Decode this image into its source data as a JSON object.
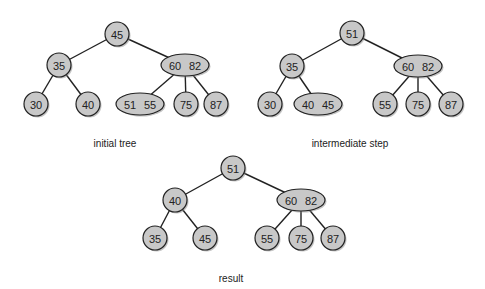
{
  "diagram": {
    "type": "2-3 tree deletion",
    "trees": [
      {
        "id": "initial",
        "caption": "initial tree",
        "nodes": [
          {
            "id": "n45",
            "keys": [
              "45"
            ],
            "cx": 117,
            "cy": 34
          },
          {
            "id": "n35",
            "keys": [
              "35"
            ],
            "cx": 59,
            "cy": 65
          },
          {
            "id": "n6082",
            "keys": [
              "60",
              "82"
            ],
            "cx": 185,
            "cy": 65
          },
          {
            "id": "n30",
            "keys": [
              "30"
            ],
            "cx": 36,
            "cy": 104
          },
          {
            "id": "n40",
            "keys": [
              "40"
            ],
            "cx": 88,
            "cy": 104
          },
          {
            "id": "n5155",
            "keys": [
              "51",
              "55"
            ],
            "cx": 140,
            "cy": 104
          },
          {
            "id": "n75",
            "keys": [
              "75"
            ],
            "cx": 186,
            "cy": 104
          },
          {
            "id": "n87",
            "keys": [
              "87"
            ],
            "cx": 216,
            "cy": 104
          }
        ],
        "edges": [
          [
            "n45",
            "n35"
          ],
          [
            "n45",
            "n6082"
          ],
          [
            "n35",
            "n30"
          ],
          [
            "n35",
            "n40"
          ],
          [
            "n6082",
            "n5155"
          ],
          [
            "n6082",
            "n75"
          ],
          [
            "n6082",
            "n87"
          ]
        ],
        "caption_pos": [
          115,
          147
        ]
      },
      {
        "id": "intermediate",
        "caption": "intermediate step",
        "nodes": [
          {
            "id": "m51",
            "keys": [
              "51"
            ],
            "cx": 352,
            "cy": 33
          },
          {
            "id": "m35",
            "keys": [
              "35"
            ],
            "cx": 292,
            "cy": 66
          },
          {
            "id": "m6082",
            "keys": [
              "60",
              "82"
            ],
            "cx": 418,
            "cy": 66
          },
          {
            "id": "m30",
            "keys": [
              "30"
            ],
            "cx": 270,
            "cy": 104
          },
          {
            "id": "m4045",
            "keys": [
              "40",
              "45"
            ],
            "cx": 318,
            "cy": 104
          },
          {
            "id": "m55",
            "keys": [
              "55"
            ],
            "cx": 385,
            "cy": 104
          },
          {
            "id": "m75",
            "keys": [
              "75"
            ],
            "cx": 418,
            "cy": 104
          },
          {
            "id": "m87",
            "keys": [
              "87"
            ],
            "cx": 451,
            "cy": 104
          }
        ],
        "edges": [
          [
            "m51",
            "m35"
          ],
          [
            "m51",
            "m6082"
          ],
          [
            "m35",
            "m30"
          ],
          [
            "m35",
            "m4045"
          ],
          [
            "m6082",
            "m55"
          ],
          [
            "m6082",
            "m75"
          ],
          [
            "m6082",
            "m87"
          ]
        ],
        "caption_pos": [
          350,
          147
        ]
      },
      {
        "id": "result",
        "caption": "result",
        "nodes": [
          {
            "id": "r51",
            "keys": [
              "51"
            ],
            "cx": 233,
            "cy": 168
          },
          {
            "id": "r40",
            "keys": [
              "40"
            ],
            "cx": 175,
            "cy": 200
          },
          {
            "id": "r6082",
            "keys": [
              "60",
              "82"
            ],
            "cx": 301,
            "cy": 200
          },
          {
            "id": "r35",
            "keys": [
              "35"
            ],
            "cx": 155,
            "cy": 238
          },
          {
            "id": "r45",
            "keys": [
              "45"
            ],
            "cx": 205,
            "cy": 238
          },
          {
            "id": "r55",
            "keys": [
              "55"
            ],
            "cx": 267,
            "cy": 238
          },
          {
            "id": "r75",
            "keys": [
              "75"
            ],
            "cx": 301,
            "cy": 238
          },
          {
            "id": "r87",
            "keys": [
              "87"
            ],
            "cx": 333,
            "cy": 238
          }
        ],
        "edges": [
          [
            "r51",
            "r40"
          ],
          [
            "r51",
            "r6082"
          ],
          [
            "r40",
            "r35"
          ],
          [
            "r40",
            "r45"
          ],
          [
            "r6082",
            "r55"
          ],
          [
            "r6082",
            "r75"
          ],
          [
            "r6082",
            "r87"
          ]
        ],
        "caption_pos": [
          231,
          282
        ]
      }
    ],
    "colors": {
      "node_fill": "#c8c8c8",
      "stroke": "#222222",
      "background": "#ffffff"
    }
  }
}
